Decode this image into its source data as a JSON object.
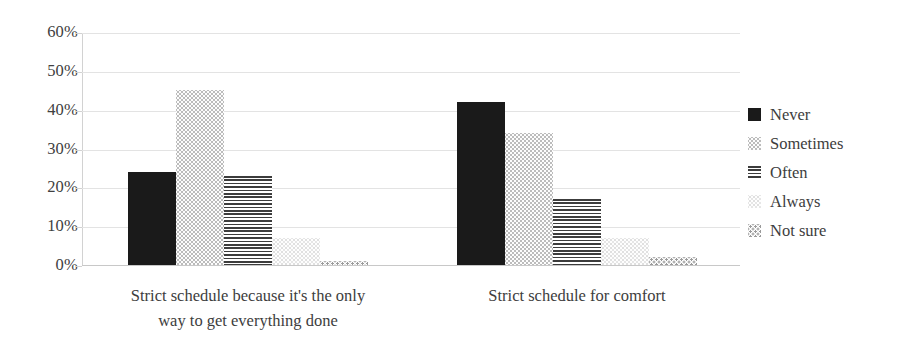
{
  "chart_data": {
    "type": "bar",
    "title": "",
    "xlabel": "",
    "ylabel": "",
    "ylim": [
      0,
      60
    ],
    "y_tick_labels": [
      "60%",
      "50%",
      "40%",
      "30%",
      "20%",
      "10%",
      "0%"
    ],
    "y_ticks": [
      60,
      50,
      40,
      30,
      20,
      10,
      0
    ],
    "grid": true,
    "legend_position": "right",
    "categories": [
      "Strict schedule because it's the only way to get everything done",
      "Strict schedule for comfort"
    ],
    "category_lines": [
      [
        "Strict schedule because it's the only",
        "way to get everything done"
      ],
      [
        "Strict schedule for comfort"
      ]
    ],
    "series": [
      {
        "name": "Never",
        "values": [
          24,
          42
        ],
        "pattern": "solid-black",
        "swatch": "fill-never"
      },
      {
        "name": "Sometimes",
        "values": [
          45,
          34
        ],
        "pattern": "light-dots",
        "swatch": "fill-sometimes"
      },
      {
        "name": "Often",
        "values": [
          23,
          17
        ],
        "pattern": "horizontal-lines",
        "swatch": "fill-often"
      },
      {
        "name": "Always",
        "values": [
          7,
          7
        ],
        "pattern": "very-light-dots",
        "swatch": "fill-always"
      },
      {
        "name": "Not sure",
        "values": [
          1,
          2
        ],
        "pattern": "sparse-dots",
        "swatch": "fill-notsure"
      }
    ]
  },
  "colors": {
    "never": "#1a1a1a",
    "often": "#3c3c3c",
    "gridline": "#e3e3e3",
    "axis": "#d2d2d2",
    "text": "#3d3d3d",
    "background": "#ffffff"
  }
}
